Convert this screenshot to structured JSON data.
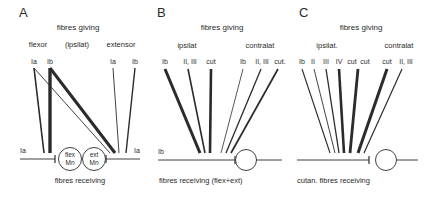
{
  "figure": {
    "panels": [
      {
        "id": "A",
        "letter": "A",
        "title": "fibres giving",
        "groups": [
          "flexor",
          "(ipsilat)",
          "extensor"
        ],
        "inputs": [
          "Ia",
          "Ib",
          "Ia",
          "Ib"
        ],
        "left_input_label": "Ia",
        "right_input_label": "Ia",
        "neurons": [
          {
            "line1": "flex",
            "line2": "Mn"
          },
          {
            "line1": "ext",
            "line2": "Mn"
          }
        ],
        "footer": "fibres receiving"
      },
      {
        "id": "B",
        "letter": "B",
        "title": "fibres giving",
        "groups": [
          "ipsilat",
          "contralat"
        ],
        "inputs": [
          "Ib",
          "II, III",
          "cut",
          "Ib",
          "II, III",
          "cut."
        ],
        "left_input_label": "Ib",
        "footer": "fibres receiving (flex+ext)"
      },
      {
        "id": "C",
        "letter": "C",
        "title": "fibres giving",
        "groups": [
          "ipsilat.",
          "contralat"
        ],
        "inputs": [
          "Ib",
          "II",
          "III",
          "IV",
          "cut",
          "cut",
          "cut",
          "II, III"
        ],
        "footer": "cutan. fibres receiving"
      }
    ]
  }
}
